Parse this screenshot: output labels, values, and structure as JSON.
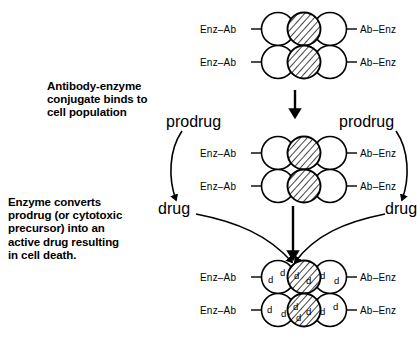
{
  "figure": {
    "captions": [
      {
        "id": "caption-binding",
        "text": "Antibody-enzyme\nconjugate binds to\ncell population"
      },
      {
        "id": "caption-conversion",
        "text": "Enzyme converts\nprodrug (or cytotoxic\nprecursor) into an\nactive drug resulting\nin cell death."
      }
    ],
    "labels": {
      "conjugate_left": "Enz–Ab",
      "conjugate_right": "Ab–Enz",
      "prodrug": "prodrug",
      "drug": "drug",
      "drug_molecule": "d"
    },
    "stages": [
      {
        "id": "stage-1-binding",
        "name": "antibody-enzyme conjugate binds to cell population",
        "left_labels": [
          "Enz–Ab",
          "Enz–Ab"
        ],
        "right_labels": [
          "Ab–Enz",
          "Ab–Enz"
        ],
        "cell_rows": [
          [
            "normal",
            "tumour",
            "normal"
          ],
          [
            "normal",
            "tumour",
            "normal"
          ]
        ]
      },
      {
        "id": "stage-2-prodrug",
        "name": "prodrug converted to drug at cell surface",
        "left_labels": [
          "Enz–Ab",
          "Enz–Ab"
        ],
        "right_labels": [
          "Ab–Enz",
          "Ab–Enz"
        ],
        "prodrug_left": "prodrug",
        "prodrug_right": "prodrug",
        "drug_left": "drug",
        "drug_right": "drug",
        "cell_rows": [
          [
            "normal",
            "tumour",
            "normal"
          ],
          [
            "normal",
            "tumour",
            "normal"
          ]
        ]
      },
      {
        "id": "stage-3-celldeath",
        "name": "active drug accumulates causing cell death",
        "left_labels": [
          "Enz–Ab",
          "Enz–Ab"
        ],
        "right_labels": [
          "Ab–Enz",
          "Ab–Enz"
        ],
        "cell_rows": [
          [
            "normal",
            "tumour",
            "normal"
          ],
          [
            "normal",
            "tumour",
            "normal"
          ]
        ],
        "drug_counts": [
          [
            2,
            2,
            2
          ],
          [
            2,
            3,
            2
          ]
        ]
      }
    ],
    "colors": {
      "ink": "#000000",
      "background": "#ffffff"
    }
  }
}
